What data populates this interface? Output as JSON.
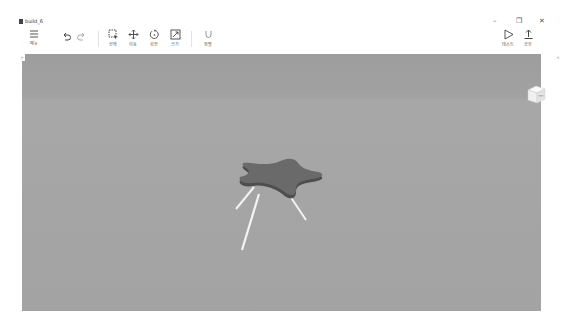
{
  "window": {
    "title": "build_6",
    "controls": {
      "minimize": "–",
      "maximize": "❐",
      "close": "✕"
    }
  },
  "toolbar": {
    "menu": {
      "label": "메뉴",
      "icon": "hamburger-icon"
    },
    "undo": {
      "icon": "undo-icon"
    },
    "redo": {
      "icon": "redo-icon"
    },
    "tools": [
      {
        "label": "선택",
        "icon": "select-icon"
      },
      {
        "label": "이동",
        "icon": "move-icon"
      },
      {
        "label": "회전",
        "icon": "rotate-icon"
      },
      {
        "label": "크기",
        "icon": "scale-icon"
      },
      {
        "label": "정렬",
        "icon": "magnet-icon"
      }
    ],
    "right": [
      {
        "label": "테스트",
        "icon": "play-icon"
      },
      {
        "label": "공유",
        "icon": "upload-icon"
      }
    ]
  },
  "panels": {
    "left_toggle": "»",
    "right_toggle": "«"
  },
  "viewport": {
    "object": "star-shaped table",
    "colors": {
      "star_top": "#6a6a6a",
      "star_edge": "#4e4e4e",
      "legs": "#f2f2f2"
    }
  }
}
